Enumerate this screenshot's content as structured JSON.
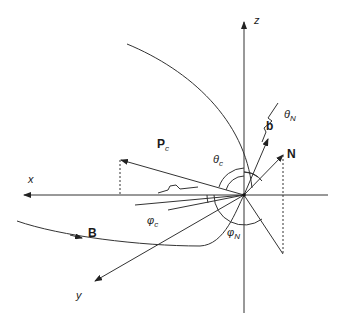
{
  "diagram": {
    "type": "3D coordinate geometry diagram",
    "axes": {
      "x": {
        "label": "x"
      },
      "y": {
        "label": "y"
      },
      "z": {
        "label": "z"
      }
    },
    "vectors": {
      "pc": {
        "label": "P",
        "subscript": "c"
      },
      "b": {
        "label": "b"
      },
      "n": {
        "label": "N"
      },
      "field": {
        "label": "B"
      }
    },
    "angles": {
      "theta_c": {
        "symbol": "θ",
        "subscript": "c"
      },
      "theta_n": {
        "symbol": "θ",
        "subscript": "N"
      },
      "phi_c": {
        "symbol": "φ",
        "subscript": "c"
      },
      "phi_n": {
        "symbol": "φ",
        "subscript": "N"
      }
    },
    "colors": {
      "line": "#333333",
      "text": "#1a1a1a",
      "background": "#ffffff"
    }
  }
}
